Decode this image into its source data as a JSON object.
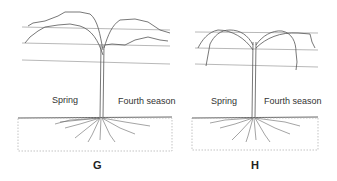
{
  "figures": [
    {
      "id": "G",
      "label": "G",
      "left_label": "Spring",
      "right_label": "Fourth season"
    },
    {
      "id": "H",
      "label": "H",
      "left_label": "Spring",
      "right_label": "Fourth season"
    }
  ],
  "colors": {
    "line": "#555555",
    "wire": "#888888",
    "background": "#ffffff"
  }
}
